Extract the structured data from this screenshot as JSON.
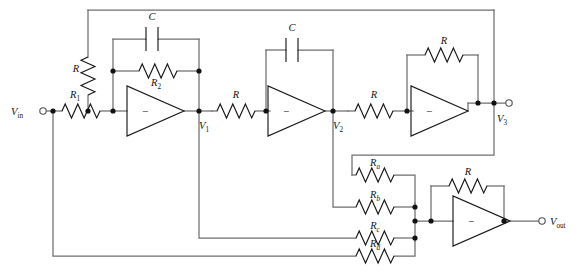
{
  "figure": {
    "type": "schematic",
    "colors": {
      "wire": "#6e6e6e",
      "device": "#1a1a1a",
      "node": "#111111",
      "background": "#ffffff",
      "label": "#141414"
    }
  },
  "terminals": [
    {
      "name": "input-terminal",
      "label": "V",
      "sub": "in",
      "x": 40,
      "y": 111
    },
    {
      "name": "v3-terminal",
      "label": "V",
      "sub": "3",
      "x": 512,
      "y": 103
    },
    {
      "name": "output-terminal",
      "label": "V",
      "sub": "out",
      "x": 545,
      "y": 213
    }
  ],
  "nodes": [
    {
      "name": "node-v1",
      "label": "V",
      "sub": "1",
      "x": 196,
      "y": 111
    },
    {
      "name": "node-v2",
      "label": "V",
      "sub": "2",
      "x": 333,
      "y": 111
    },
    {
      "name": "node-v3",
      "label": "V",
      "sub": "3",
      "x": 494,
      "y": 103
    }
  ],
  "components": [
    {
      "name": "resistor-r1",
      "label": "R",
      "sub": "1",
      "kind": "resistor",
      "orientation": "horizontal"
    },
    {
      "name": "resistor-r-shunt",
      "label": "R",
      "sub": "",
      "kind": "resistor",
      "orientation": "vertical"
    },
    {
      "name": "resistor-r2",
      "label": "R",
      "sub": "2",
      "kind": "resistor",
      "orientation": "horizontal"
    },
    {
      "name": "capacitor-c1",
      "label": "C",
      "sub": "",
      "kind": "capacitor",
      "orientation": "horizontal"
    },
    {
      "name": "resistor-r-stage2",
      "label": "R",
      "sub": "",
      "kind": "resistor",
      "orientation": "horizontal"
    },
    {
      "name": "capacitor-c2",
      "label": "C",
      "sub": "",
      "kind": "capacitor",
      "orientation": "horizontal"
    },
    {
      "name": "resistor-r-stage3",
      "label": "R",
      "sub": "",
      "kind": "resistor",
      "orientation": "horizontal"
    },
    {
      "name": "resistor-r-fb3",
      "label": "R",
      "sub": "",
      "kind": "resistor",
      "orientation": "horizontal"
    },
    {
      "name": "resistor-ra",
      "label": "R",
      "sub": "a",
      "kind": "resistor",
      "orientation": "horizontal"
    },
    {
      "name": "resistor-rb",
      "label": "R",
      "sub": "b",
      "kind": "resistor",
      "orientation": "horizontal"
    },
    {
      "name": "resistor-rc",
      "label": "R",
      "sub": "c",
      "kind": "resistor",
      "orientation": "horizontal"
    },
    {
      "name": "resistor-rd",
      "label": "R",
      "sub": "d",
      "kind": "resistor",
      "orientation": "horizontal"
    },
    {
      "name": "resistor-r-fb4",
      "label": "R",
      "sub": "",
      "kind": "resistor",
      "orientation": "horizontal"
    }
  ],
  "amplifiers": [
    {
      "name": "opamp-1",
      "input_sign": "−"
    },
    {
      "name": "opamp-2",
      "input_sign": "−"
    },
    {
      "name": "opamp-3",
      "input_sign": "−"
    },
    {
      "name": "opamp-4",
      "input_sign": "−"
    }
  ],
  "labels": {
    "r1": "R",
    "r1_sub": "1",
    "r_shunt": "R",
    "r2": "R",
    "r2_sub": "2",
    "c1": "C",
    "r_stage2": "R",
    "c2": "C",
    "r_stage3": "R",
    "r_fb3": "R",
    "ra": "R",
    "ra_sub": "a",
    "rb": "R",
    "rb_sub": "b",
    "rc": "R",
    "rc_sub": "c",
    "rd": "R",
    "rd_sub": "d",
    "r_fb4": "R",
    "vin": "V",
    "vin_sub": "in",
    "v1": "V",
    "v1_sub": "1",
    "v2": "V",
    "v2_sub": "2",
    "v3": "V",
    "v3_sub": "3",
    "vout": "V",
    "vout_sub": "out",
    "minus": "−"
  }
}
